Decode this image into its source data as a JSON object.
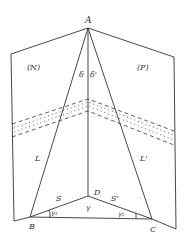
{
  "diagram": {
    "labels": {
      "apex": "A",
      "left_base": "B",
      "right_base": "C",
      "center_base": "D",
      "left_plane": "(N)",
      "right_plane": "(P)",
      "left_edge": "L",
      "right_edge": "L'",
      "left_base_edge": "S",
      "right_base_edge": "S'",
      "angle_left_apex": "δ",
      "angle_right_apex": "δ'",
      "angle_at_D": "γ",
      "angle_at_B": "γ₁",
      "angle_at_C": "γ₂"
    },
    "colors": {
      "stroke": "#333333",
      "background": "#ffffff"
    }
  }
}
